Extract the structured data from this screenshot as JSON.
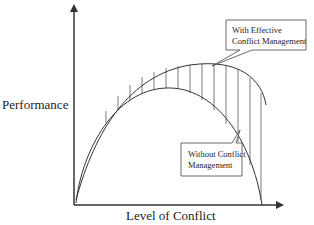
{
  "axes": {
    "y_label": "Performance",
    "x_label": "Level of Conflict"
  },
  "callouts": [
    {
      "text_line1": "With Effective",
      "text_line2": "Conflict Management"
    },
    {
      "text_line1": "Without Conflict",
      "text_line2": "Management"
    }
  ],
  "colors": {
    "line": "#333333",
    "background": "#ffffff"
  },
  "curves": [
    {
      "name": "With Effective Conflict Management",
      "shape": "asymmetric hump, higher and wider, peak shifted right"
    },
    {
      "name": "Without Conflict Management",
      "shape": "symmetric inverted-U arc"
    }
  ]
}
